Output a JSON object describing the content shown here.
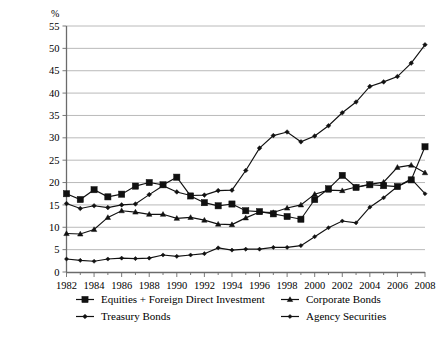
{
  "chart_data": {
    "type": "line",
    "title": "",
    "xlabel": "",
    "ylabel": "%",
    "ylim": [
      0,
      55
    ],
    "xlim": [
      1982,
      2008
    ],
    "ytick_step": 5,
    "xtick_step": 2,
    "grid": true,
    "legend_position": "bottom",
    "yticks": [
      "0",
      "5",
      "10",
      "15",
      "20",
      "25",
      "30",
      "35",
      "40",
      "45",
      "50",
      "55"
    ],
    "xticks": [
      "1982",
      "1984",
      "1986",
      "1988",
      "1990",
      "1992",
      "1994",
      "1996",
      "1998",
      "2000",
      "2002",
      "2004",
      "2006",
      "2008"
    ],
    "x": [
      1982,
      1983,
      1984,
      1985,
      1986,
      1987,
      1988,
      1989,
      1990,
      1991,
      1992,
      1993,
      1994,
      1995,
      1996,
      1997,
      1998,
      1999,
      2000,
      2001,
      2002,
      2003,
      2004,
      2005,
      2006,
      2007,
      2008
    ],
    "series": [
      {
        "name": "Equities + Foreign Direct Investment",
        "marker": "square",
        "values": [
          17.5,
          16.2,
          18.4,
          16.8,
          17.4,
          19.2,
          20.0,
          19.5,
          21.2,
          17.0,
          15.5,
          14.8,
          15.2,
          13.7,
          13.5,
          13.0,
          12.4,
          11.8,
          16.2,
          18.6,
          21.6,
          18.9,
          19.5,
          19.3,
          19.1,
          20.6,
          28.0
        ]
      },
      {
        "name": "Treasury Bonds",
        "marker": "diamond",
        "values": [
          15.3,
          14.2,
          14.8,
          14.4,
          15.0,
          15.2,
          17.3,
          19.3,
          17.9,
          17.1,
          17.2,
          18.2,
          18.3,
          22.7,
          27.7,
          30.5,
          31.3,
          29.1,
          30.4,
          32.7,
          35.6,
          38.0,
          41.5,
          42.5,
          43.7,
          46.7,
          50.8
        ]
      },
      {
        "name": "Corporate Bonds",
        "marker": "triangle",
        "values": [
          8.6,
          8.5,
          9.5,
          12.2,
          13.7,
          13.4,
          12.9,
          12.9,
          12.0,
          12.2,
          11.6,
          10.7,
          10.6,
          12.1,
          13.4,
          13.3,
          14.3,
          15.0,
          17.4,
          18.3,
          18.2,
          19.0,
          19.6,
          20.1,
          23.4,
          23.9,
          22.2
        ]
      },
      {
        "name": "Agency Securities",
        "marker": "diamond-small",
        "values": [
          2.9,
          2.6,
          2.4,
          2.9,
          3.1,
          3.0,
          3.1,
          3.8,
          3.5,
          3.8,
          4.1,
          5.4,
          4.9,
          5.1,
          5.1,
          5.5,
          5.5,
          5.9,
          7.9,
          9.9,
          11.4,
          11.0,
          14.5,
          16.6,
          19.1,
          20.8,
          17.5
        ]
      }
    ]
  },
  "legend": {
    "items": [
      {
        "label": "Equities + Foreign Direct Investment",
        "marker": "square"
      },
      {
        "label": "Corporate Bonds",
        "marker": "triangle"
      },
      {
        "label": "Treasury Bonds",
        "marker": "diamond"
      },
      {
        "label": "Agency Securities",
        "marker": "diamond-small"
      }
    ]
  },
  "colors": {
    "ink": "#111111",
    "grid": "#a8a8a8",
    "axis": "#6b6b6b",
    "background": "#ffffff"
  }
}
